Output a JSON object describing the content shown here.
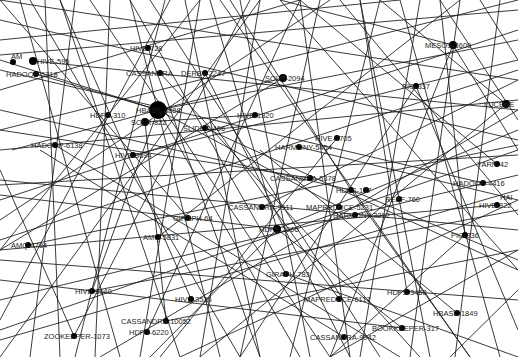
{
  "graph": {
    "width": 518,
    "height": 357,
    "background": "#ffffff",
    "edge_color": "#1a1a1a",
    "node_color": "#000000",
    "nodes": [
      {
        "id": "amh_top",
        "label": "AM",
        "x": 13,
        "y": 62,
        "r": 3,
        "lx": -2,
        "ly": -3
      },
      {
        "id": "hive_595",
        "label": "HIVE-595",
        "x": 33,
        "y": 61,
        "r": 4,
        "lx": 4,
        "ly": 3
      },
      {
        "id": "hadoop_5318",
        "label": "HADOOP-5318",
        "x": 36,
        "y": 74,
        "r": 3,
        "lx": -30,
        "ly": 3
      },
      {
        "id": "hive_728",
        "label": "HIVE-728",
        "x": 148,
        "y": 48,
        "r": 3,
        "lx": -18,
        "ly": 3
      },
      {
        "id": "cassandra_top",
        "label": "CASSANDRA",
        "x": 160,
        "y": 73,
        "r": 3,
        "lx": -34,
        "ly": 3
      },
      {
        "id": "derby_2247",
        "label": "DERBY-2247",
        "x": 205,
        "y": 73,
        "r": 3,
        "lx": -24,
        "ly": 3
      },
      {
        "id": "solr_2094",
        "label": "SOLR-2094",
        "x": 283,
        "y": 78,
        "r": 4,
        "lx": -18,
        "ly": 3
      },
      {
        "id": "mesos_3609",
        "label": "MESOS-3609",
        "x": 453,
        "y": 45,
        "r": 4,
        "lx": -28,
        "ly": 3
      },
      {
        "id": "pig_337",
        "label": "PIG-337",
        "x": 416,
        "y": 86,
        "r": 3,
        "lx": -14,
        "ly": 3
      },
      {
        "id": "lucene",
        "label": "LUCENE",
        "x": 506,
        "y": 104,
        "r": 4,
        "lx": -22,
        "ly": 3
      },
      {
        "id": "hbase_big",
        "label": "HBASE-8888",
        "x": 158,
        "y": 110,
        "r": 9,
        "lx": -22,
        "ly": 3
      },
      {
        "id": "hdfs_310",
        "label": "HDFS-310",
        "x": 108,
        "y": 115,
        "r": 3,
        "lx": -18,
        "ly": 3
      },
      {
        "id": "solr_mid",
        "label": "SOLR-822",
        "x": 145,
        "y": 122,
        "r": 4,
        "lx": -14,
        "ly": 3
      },
      {
        "id": "hive_1820",
        "label": "HIVE-1820",
        "x": 255,
        "y": 115,
        "r": 3,
        "lx": -18,
        "ly": 3
      },
      {
        "id": "slider_466",
        "label": "SLIDER-466",
        "x": 205,
        "y": 128,
        "r": 3,
        "lx": -22,
        "ly": 3
      },
      {
        "id": "hadoop_6138",
        "label": "HADOOP-6138",
        "x": 55,
        "y": 145,
        "r": 3,
        "lx": -24,
        "ly": 3
      },
      {
        "id": "hive_3694",
        "label": "HIVE-3694",
        "x": 133,
        "y": 155,
        "r": 3,
        "lx": -18,
        "ly": 3
      },
      {
        "id": "hive_1705",
        "label": "HIVE-1705",
        "x": 337,
        "y": 138,
        "r": 3,
        "lx": -22,
        "ly": 3
      },
      {
        "id": "harmony_5454",
        "label": "HARMONY-5454",
        "x": 299,
        "y": 147,
        "r": 3,
        "lx": -24,
        "ly": 3
      },
      {
        "id": "cassandra_5378",
        "label": "CASSANDRA-5378",
        "x": 310,
        "y": 178,
        "r": 3,
        "lx": -40,
        "ly": 3
      },
      {
        "id": "hdfs_187",
        "label": "HDFS-187",
        "x": 351,
        "y": 190,
        "r": 3,
        "lx": -15,
        "ly": 3
      },
      {
        "id": "mid_node_a",
        "label": "",
        "x": 366,
        "y": 190,
        "r": 3,
        "lx": 0,
        "ly": 0
      },
      {
        "id": "reef_760",
        "label": "REEF-760",
        "x": 399,
        "y": 199,
        "r": 3,
        "lx": -14,
        "ly": 3
      },
      {
        "id": "yarn",
        "label": "YARN-42",
        "x": 497,
        "y": 164,
        "r": 3,
        "lx": -20,
        "ly": 3
      },
      {
        "id": "hadoop_4416",
        "label": "HADOOP-4416",
        "x": 483,
        "y": 183,
        "r": 3,
        "lx": -30,
        "ly": 3
      },
      {
        "id": "hive_right",
        "label": "HIVE-822",
        "x": 497,
        "y": 205,
        "r": 3,
        "lx": -18,
        "ly": 3
      },
      {
        "id": "hai_right",
        "label": "HAI",
        "x": 506,
        "y": 197,
        "r": 0,
        "lx": -6,
        "ly": 3
      },
      {
        "id": "cassandra_9911",
        "label": "CASSANDRA-9911",
        "x": 262,
        "y": 207,
        "r": 3,
        "lx": -34,
        "ly": 3
      },
      {
        "id": "mapreduce_5231",
        "label": "MAPREDUCE-5231",
        "x": 339,
        "y": 207,
        "r": 3,
        "lx": -33,
        "ly": 3
      },
      {
        "id": "harmony_3292",
        "label": "HARMONY-3292",
        "x": 355,
        "y": 215,
        "r": 3,
        "lx": -22,
        "ly": 3
      },
      {
        "id": "giraph_64",
        "label": "GIRAPH-64",
        "x": 188,
        "y": 218,
        "r": 3,
        "lx": -15,
        "ly": 3
      },
      {
        "id": "hdfs_2006",
        "label": "HDFS-2006",
        "x": 277,
        "y": 229,
        "r": 4,
        "lx": -18,
        "ly": 3
      },
      {
        "id": "pig_336",
        "label": "PIG-336",
        "x": 465,
        "y": 235,
        "r": 3,
        "lx": -14,
        "ly": 3
      },
      {
        "id": "amq_4784",
        "label": "AMQ-4784",
        "x": 28,
        "y": 245,
        "r": 3,
        "lx": -17,
        "ly": 3
      },
      {
        "id": "amq_5831",
        "label": "AMQ-5831",
        "x": 158,
        "y": 237,
        "r": 3,
        "lx": -15,
        "ly": 3
      },
      {
        "id": "giraph_783",
        "label": "GIRAPH-783",
        "x": 286,
        "y": 274,
        "r": 3,
        "lx": -20,
        "ly": 3
      },
      {
        "id": "hive_3640",
        "label": "HIVE-3640",
        "x": 92,
        "y": 291,
        "r": 3,
        "lx": -17,
        "ly": 3
      },
      {
        "id": "hive_3526",
        "label": "HIVE-3526",
        "x": 191,
        "y": 299,
        "r": 3,
        "lx": -16,
        "ly": 3
      },
      {
        "id": "mapreduce_6117",
        "label": "MAPREDUCE-6117",
        "x": 339,
        "y": 299,
        "r": 3,
        "lx": -35,
        "ly": 3
      },
      {
        "id": "hdfs_3458",
        "label": "HDFS-3458",
        "x": 407,
        "y": 292,
        "r": 3,
        "lx": -20,
        "ly": 3
      },
      {
        "id": "hbase_1849",
        "label": "HBASE-1849",
        "x": 457,
        "y": 313,
        "r": 3,
        "lx": -24,
        "ly": 3
      },
      {
        "id": "cassandra_10052",
        "label": "CASSANDRA-10052",
        "x": 166,
        "y": 321,
        "r": 3,
        "lx": -45,
        "ly": 3
      },
      {
        "id": "bookkeeper_317",
        "label": "BOOKKEEPER-317",
        "x": 402,
        "y": 328,
        "r": 3,
        "lx": -30,
        "ly": 3
      },
      {
        "id": "zookeeper_1073",
        "label": "ZOOKEEPER-1073",
        "x": 74,
        "y": 336,
        "r": 3,
        "lx": -30,
        "ly": 3
      },
      {
        "id": "hdfs_6220",
        "label": "HDFS-6220",
        "x": 147,
        "y": 332,
        "r": 3,
        "lx": -18,
        "ly": 3
      },
      {
        "id": "cassandra_9942",
        "label": "CASSANDRA-9942",
        "x": 344,
        "y": 337,
        "r": 3,
        "lx": -34,
        "ly": 3
      }
    ],
    "edges": [
      [
        0,
        0,
        518,
        80
      ],
      [
        0,
        20,
        518,
        140
      ],
      [
        0,
        40,
        400,
        0
      ],
      [
        0,
        55,
        518,
        10
      ],
      [
        0,
        90,
        300,
        0
      ],
      [
        0,
        130,
        518,
        0
      ],
      [
        0,
        150,
        518,
        100
      ],
      [
        0,
        180,
        518,
        230
      ],
      [
        0,
        185,
        518,
        155
      ],
      [
        0,
        220,
        330,
        0
      ],
      [
        0,
        250,
        200,
        0
      ],
      [
        0,
        260,
        518,
        300
      ],
      [
        0,
        300,
        518,
        175
      ],
      [
        0,
        320,
        170,
        0
      ],
      [
        0,
        340,
        518,
        190
      ],
      [
        0,
        357,
        260,
        0
      ],
      [
        20,
        0,
        120,
        357
      ],
      [
        30,
        0,
        240,
        357
      ],
      [
        45,
        0,
        60,
        357
      ],
      [
        60,
        0,
        180,
        357
      ],
      [
        75,
        0,
        30,
        357
      ],
      [
        90,
        0,
        330,
        357
      ],
      [
        110,
        0,
        95,
        357
      ],
      [
        130,
        0,
        220,
        357
      ],
      [
        150,
        0,
        380,
        357
      ],
      [
        165,
        0,
        75,
        357
      ],
      [
        185,
        0,
        260,
        357
      ],
      [
        200,
        0,
        140,
        357
      ],
      [
        220,
        0,
        470,
        357
      ],
      [
        240,
        0,
        310,
        357
      ],
      [
        260,
        0,
        200,
        357
      ],
      [
        280,
        0,
        518,
        270
      ],
      [
        300,
        0,
        350,
        357
      ],
      [
        320,
        0,
        240,
        357
      ],
      [
        340,
        0,
        518,
        215
      ],
      [
        360,
        0,
        430,
        357
      ],
      [
        380,
        0,
        290,
        357
      ],
      [
        400,
        0,
        500,
        357
      ],
      [
        420,
        0,
        360,
        357
      ],
      [
        440,
        0,
        518,
        120
      ],
      [
        460,
        0,
        410,
        357
      ],
      [
        480,
        0,
        518,
        60
      ],
      [
        500,
        0,
        455,
        357
      ],
      [
        518,
        30,
        0,
        200
      ],
      [
        518,
        70,
        0,
        240
      ],
      [
        518,
        110,
        100,
        357
      ],
      [
        518,
        150,
        0,
        330
      ],
      [
        518,
        200,
        180,
        357
      ],
      [
        518,
        250,
        330,
        357
      ],
      [
        518,
        290,
        450,
        357
      ],
      [
        158,
        110,
        518,
        40
      ],
      [
        158,
        110,
        0,
        60
      ],
      [
        158,
        110,
        300,
        357
      ],
      [
        158,
        110,
        36,
        74
      ],
      [
        158,
        110,
        283,
        78
      ],
      [
        158,
        110,
        339,
        207
      ],
      [
        158,
        110,
        92,
        291
      ],
      [
        158,
        110,
        12,
        150
      ],
      [
        145,
        122,
        166,
        321
      ],
      [
        145,
        122,
        255,
        115
      ],
      [
        277,
        229,
        210,
        0
      ],
      [
        277,
        229,
        518,
        130
      ],
      [
        277,
        229,
        150,
        357
      ],
      [
        277,
        229,
        402,
        328
      ],
      [
        277,
        229,
        0,
        195
      ],
      [
        351,
        190,
        518,
        260
      ],
      [
        351,
        190,
        230,
        0
      ],
      [
        351,
        190,
        0,
        110
      ],
      [
        351,
        190,
        470,
        357
      ],
      [
        453,
        45,
        330,
        357
      ],
      [
        453,
        45,
        518,
        150
      ],
      [
        453,
        45,
        280,
        0
      ],
      [
        416,
        86,
        518,
        330
      ],
      [
        416,
        86,
        240,
        357
      ],
      [
        506,
        104,
        380,
        0
      ],
      [
        506,
        104,
        200,
        357
      ],
      [
        497,
        164,
        300,
        0
      ],
      [
        483,
        183,
        0,
        70
      ],
      [
        497,
        205,
        0,
        250
      ],
      [
        465,
        235,
        440,
        0
      ],
      [
        465,
        235,
        330,
        357
      ],
      [
        407,
        292,
        360,
        0
      ],
      [
        457,
        313,
        260,
        150
      ],
      [
        339,
        299,
        210,
        120
      ],
      [
        286,
        274,
        130,
        0
      ],
      [
        286,
        274,
        518,
        357
      ],
      [
        191,
        299,
        60,
        0
      ],
      [
        166,
        321,
        518,
        250
      ],
      [
        74,
        336,
        0,
        170
      ],
      [
        74,
        336,
        250,
        0
      ],
      [
        147,
        332,
        300,
        0
      ],
      [
        344,
        337,
        40,
        150
      ],
      [
        402,
        328,
        0,
        280
      ],
      [
        92,
        291,
        518,
        210
      ],
      [
        28,
        245,
        518,
        145
      ],
      [
        158,
        237,
        460,
        0
      ],
      [
        188,
        218,
        0,
        0
      ],
      [
        262,
        207,
        518,
        80
      ],
      [
        310,
        178,
        0,
        130
      ],
      [
        299,
        147,
        518,
        200
      ],
      [
        337,
        138,
        160,
        357
      ],
      [
        133,
        155,
        518,
        60
      ],
      [
        55,
        145,
        400,
        357
      ],
      [
        205,
        128,
        518,
        270
      ],
      [
        205,
        73,
        350,
        357
      ],
      [
        160,
        73,
        420,
        357
      ],
      [
        148,
        48,
        260,
        357
      ],
      [
        33,
        61,
        518,
        110
      ],
      [
        283,
        78,
        0,
        250
      ]
    ]
  }
}
